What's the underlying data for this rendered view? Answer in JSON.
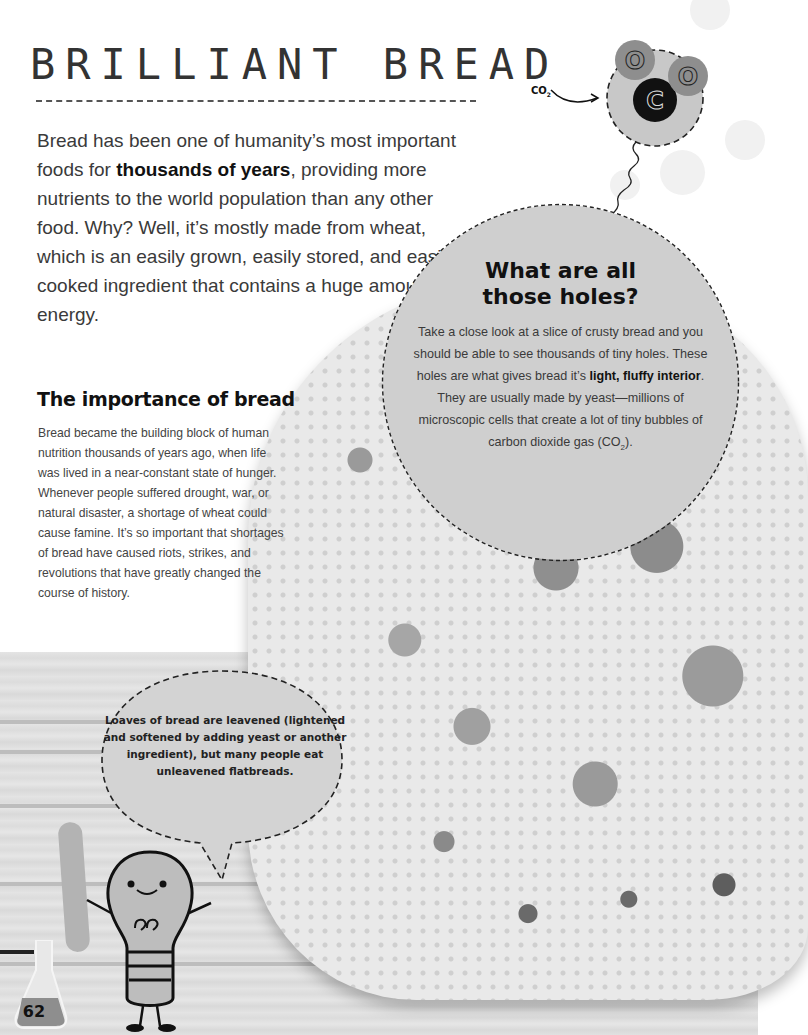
{
  "page": {
    "title": "BRILLIANT BREAD",
    "page_number": "62"
  },
  "intro": {
    "segments": [
      {
        "text": "Bread has been one of humanity’s most important foods for ",
        "bold": false
      },
      {
        "text": "thousands of years",
        "bold": true
      },
      {
        "text": ", providing more nutrients to the world population than any other food. Why? Well, it’s mostly made from wheat, which is an easily grown, easily stored, and easily cooked ingredient that contains a huge amount of energy.",
        "bold": false
      }
    ]
  },
  "importance": {
    "heading": "The importance of bread",
    "body": "Bread became the building block of human nutrition thousands of years ago, when life was lived in a near-constant state of hunger. Whenever people suffered drought, war, or natural disaster, a shortage of wheat could cause famine. It’s so important that shortages of bread have caused riots, strikes, and revolutions that have greatly changed the course of history."
  },
  "holes_callout": {
    "heading_line1": "What are all",
    "heading_line2": "those holes?",
    "body_before": "Take a close look at a slice of crusty bread and you should be able to see thousands of tiny holes. These holes are what gives bread it’s ",
    "body_bold": "light, fluffy interior",
    "body_after": ". They are usually made by yeast—millions of microscopic cells that create a lot of tiny bubbles of carbon dioxide gas (CO",
    "body_sub": "2",
    "body_end": ")."
  },
  "molecule": {
    "label": "CO",
    "label_sub": "2",
    "atoms": [
      {
        "symbol": "O",
        "role": "oxygen-top"
      },
      {
        "symbol": "C",
        "role": "carbon-center"
      },
      {
        "symbol": "O",
        "role": "oxygen-right"
      }
    ]
  },
  "speech_bubble": {
    "text": "Loaves of bread are leavened (lightened and softened by adding yeast or another ingredient), but many people eat unleavened flatbreads."
  },
  "colors": {
    "text_dark": "#111111",
    "text_body": "#3a3a3a",
    "callout_fill": "#cfcfcf",
    "oxygen_fill": "#8e8e8e",
    "carbon_fill": "#111111",
    "molecule_halo": "#c8c8c8"
  }
}
